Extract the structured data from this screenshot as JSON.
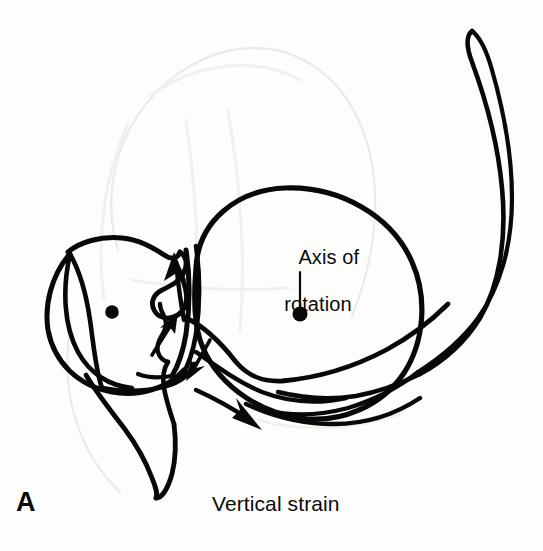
{
  "figure": {
    "panel_letter": "A",
    "caption": "Vertical strain",
    "annotation": {
      "line1": "Axis of",
      "line2": "rotation"
    },
    "ink_color": "#080808",
    "background_color": "#fdfdfc",
    "width": 543,
    "height": 551
  },
  "markers": {
    "left_axis_dot": {
      "name": "innominate-axis-dot",
      "cx": 112,
      "cy": 312,
      "r": 7
    },
    "right_axis_dot": {
      "name": "sacral-axis-dot",
      "cx": 300,
      "cy": 315,
      "r": 7.5
    }
  },
  "arrows": [
    {
      "name": "superior-arrow",
      "direction": "up",
      "label": ""
    },
    {
      "name": "anterior-superior-arrow",
      "direction": "up-right",
      "label": ""
    },
    {
      "name": "inferior-arrow",
      "direction": "down-left",
      "label": ""
    },
    {
      "name": "inferolateral-arrow",
      "direction": "down-right",
      "label": ""
    }
  ],
  "shapes": {
    "sacral_circle": {
      "name": "axis-of-rotation-circle",
      "cx": 303,
      "cy": 300,
      "r": 113
    },
    "innominate_circle": {
      "name": "innominate-circle",
      "cx": 113,
      "cy": 313,
      "r": 72
    }
  }
}
